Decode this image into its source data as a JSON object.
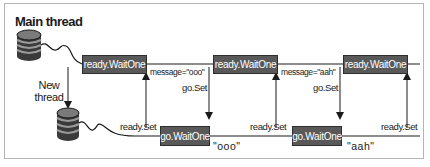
{
  "diagram": {
    "title": "Main thread",
    "new_thread_label": [
      "New",
      "thread"
    ],
    "main_thread_boxes": [
      "ready.WaitOne",
      "ready.WaitOne",
      "ready.WaitOne"
    ],
    "worker_thread_boxes": [
      "go.WaitOne",
      "go.WaitOne"
    ],
    "messages": [
      "message=\"ooo\"",
      "message=\"aah\""
    ],
    "go_set_labels": [
      "go.Set",
      "go.Set"
    ],
    "ready_set_labels": [
      "ready.Set",
      "ready.Set",
      "ready.Set"
    ],
    "received_values": [
      "\"ooo\"",
      "\"aah\""
    ],
    "colors": {
      "box_fill": "#595959",
      "box_text": "#ffffff",
      "line": "#1a1a1a",
      "frame": "#b5b5b5"
    }
  }
}
